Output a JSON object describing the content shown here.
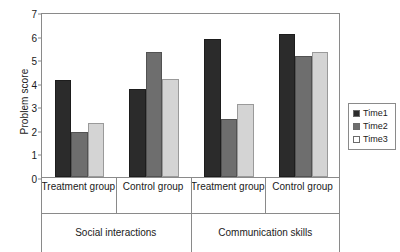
{
  "chart_data": {
    "type": "bar",
    "title": "",
    "xlabel": "",
    "ylabel": "Problem score",
    "ylim": [
      0,
      7
    ],
    "yticks": [
      0,
      1,
      2,
      3,
      4,
      5,
      6,
      7
    ],
    "grid": false,
    "legend_position": "right",
    "categories": [
      "Treatment group",
      "Control group",
      "Treatment group",
      "Control group"
    ],
    "supergroups": [
      {
        "label": "Social interactions",
        "categories": [
          "Treatment group",
          "Control group"
        ]
      },
      {
        "label": "Communication skills",
        "categories": [
          "Treatment group",
          "Control group"
        ]
      }
    ],
    "series": [
      {
        "name": "Time1",
        "color": "#2b2b2b",
        "values": [
          4.1,
          3.75,
          5.85,
          6.05
        ]
      },
      {
        "name": "Time2",
        "color": "#6e6e6e",
        "values": [
          1.9,
          5.3,
          2.45,
          5.15
        ]
      },
      {
        "name": "Time3",
        "color": "#d4d4d4",
        "values": [
          2.3,
          4.15,
          3.1,
          5.3
        ]
      }
    ]
  },
  "legend": {
    "items": [
      {
        "label": "Time1"
      },
      {
        "label": "Time2"
      },
      {
        "label": "Time3"
      }
    ]
  }
}
